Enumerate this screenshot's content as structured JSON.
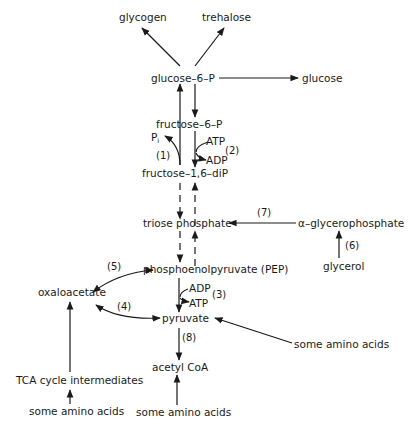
{
  "diagram": {
    "type": "metabolic-pathway",
    "nodes": {
      "glycogen": "glycogen",
      "trehalose": "trehalose",
      "glucose6p": "glucose–6–P",
      "glucose": "glucose",
      "fructose6p": "fructose–6–P",
      "fructose16dip": "fructose–1,6–diP",
      "triose_phosphate": "triose phosphate",
      "alpha_glycerophosphate": "α–glycerophosphate",
      "glycerol": "glycerol",
      "pep": "phosphoenolpyruvate (PEP)",
      "oxaloacetate": "oxaloacetate",
      "pyruvate": "pyruvate",
      "acetyl_coa": "acetyl CoA",
      "tca_intermediates": "TCA cycle intermediates",
      "amino_acids_tca": "some amino acids",
      "amino_acids_acetyl": "some amino acids",
      "amino_acids_pyruvate": "some amino acids"
    },
    "cofactors": {
      "pi": "P",
      "pi_sub": "i",
      "atp_2": "ATP",
      "adp_2": "ADP",
      "adp_3": "ADP",
      "atp_3": "ATP"
    },
    "reaction_labels": {
      "r1": "(1)",
      "r2": "(2)",
      "r3": "(3)",
      "r4": "(4)",
      "r5": "(5)",
      "r6": "(6)",
      "r7": "(7)",
      "r8": "(8)"
    },
    "edges": [
      {
        "from": "glucose6p",
        "to": "glycogen"
      },
      {
        "from": "glucose6p",
        "to": "trehalose"
      },
      {
        "from": "glucose6p",
        "to": "glucose"
      },
      {
        "from": "glucose6p",
        "to": "fructose6p"
      },
      {
        "from": "fructose6p",
        "to": "glucose6p"
      },
      {
        "from": "fructose16dip",
        "to": "fructose6p",
        "reaction": "(1)",
        "byproduct": "Pi"
      },
      {
        "from": "fructose6p",
        "to": "fructose16dip",
        "reaction": "(2)",
        "cofactors": [
          "ATP",
          "ADP"
        ]
      },
      {
        "from": "fructose16dip",
        "to": "triose_phosphate",
        "style": "dashed"
      },
      {
        "from": "triose_phosphate",
        "to": "fructose16dip",
        "style": "dashed"
      },
      {
        "from": "alpha_glycerophosphate",
        "to": "triose_phosphate",
        "reaction": "(7)"
      },
      {
        "from": "glycerol",
        "to": "alpha_glycerophosphate",
        "reaction": "(6)"
      },
      {
        "from": "triose_phosphate",
        "to": "pep",
        "style": "dashed"
      },
      {
        "from": "pep",
        "to": "triose_phosphate",
        "style": "dashed"
      },
      {
        "from": "oxaloacetate",
        "to": "pep",
        "reaction": "(5)"
      },
      {
        "from": "pyruvate",
        "to": "oxaloacetate",
        "reaction": "(4)",
        "bidirectional": true
      },
      {
        "from": "pep",
        "to": "pyruvate",
        "reaction": "(3)",
        "cofactors": [
          "ADP",
          "ATP"
        ]
      },
      {
        "from": "amino_acids_pyruvate",
        "to": "pyruvate"
      },
      {
        "from": "pyruvate",
        "to": "acetyl_coa",
        "reaction": "(8)"
      },
      {
        "from": "amino_acids_acetyl",
        "to": "acetyl_coa"
      },
      {
        "from": "tca_intermediates",
        "to": "oxaloacetate"
      },
      {
        "from": "amino_acids_tca",
        "to": "tca_intermediates"
      }
    ]
  }
}
